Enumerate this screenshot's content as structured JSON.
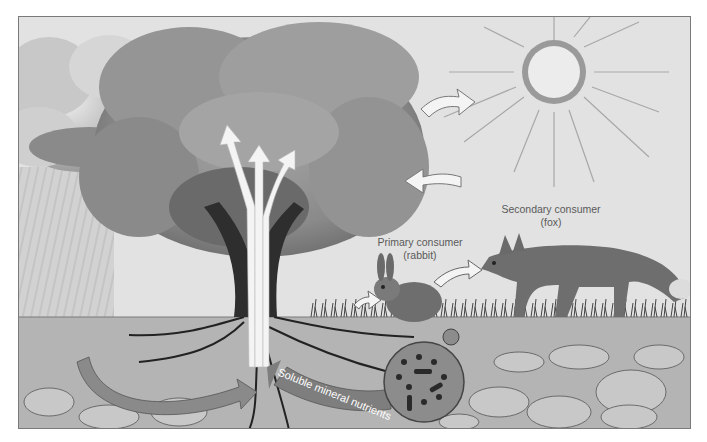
{
  "diagram": {
    "style": "grayscale illustration",
    "elements": {
      "sun": {
        "icon": "sun-icon"
      },
      "clouds": {
        "icon": "cloud-icon"
      },
      "rain": {
        "icon": "rain-icon"
      },
      "tree": {
        "icon": "tree-icon"
      },
      "rabbit": {
        "icon": "rabbit-icon"
      },
      "fox": {
        "icon": "fox-icon"
      },
      "decomposers": {
        "icon": "microbe-magnifier-icon"
      },
      "soil": {
        "icon": "soil-rocks-icon"
      }
    },
    "labels": {
      "secondary_consumer": {
        "line1": "Secondary consumer",
        "line2": "(fox)"
      },
      "primary_consumer": {
        "line1": "Primary consumer",
        "line2": "(rabbit)"
      },
      "nutrients": "Soluble mineral nutrients"
    },
    "arrows": [
      {
        "from": "tree",
        "to": "sky",
        "meaning": "energy/gas out"
      },
      {
        "from": "sky",
        "to": "tree",
        "meaning": "energy/gas in"
      },
      {
        "from": "ground",
        "to": "rabbit"
      },
      {
        "from": "rabbit",
        "to": "fox"
      },
      {
        "from": "roots",
        "to": "canopy",
        "count": 3
      },
      {
        "from": "decomposers",
        "to": "roots",
        "label_ref": "nutrients"
      },
      {
        "from": "soil",
        "to": "roots",
        "meaning": "water uptake"
      }
    ],
    "colors": {
      "sky": "#e4e4e4",
      "canopy": "#8c8c8c",
      "trunk": "#2e2e2e",
      "ground": "#b8b8b8",
      "arrow_fill": "#f4f4f4",
      "nutrient_arrow": "#8a8a8a",
      "sun": "#9a9a9a",
      "text": "#5a5a5a"
    }
  }
}
